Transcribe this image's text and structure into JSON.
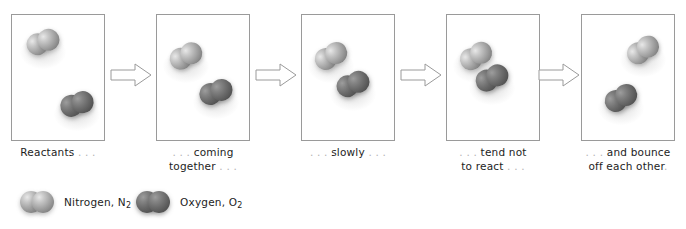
{
  "figure": {
    "panel_count": 5
  },
  "panels": [
    {
      "index": 1,
      "caption_lines": [
        "Reactants . . ."
      ],
      "caption_text": "Reactants . . .",
      "molecules": [
        {
          "species": "nitrogen",
          "label": "N2",
          "x": 14,
          "y": 16,
          "rotation": -22
        },
        {
          "species": "oxygen",
          "label": "O2",
          "x": 48,
          "y": 78,
          "rotation": -18
        }
      ]
    },
    {
      "index": 2,
      "caption_lines": [
        ". . . coming",
        "together . . ."
      ],
      "caption_text": ". . . coming together . . .",
      "molecules": [
        {
          "species": "nitrogen",
          "label": "N2",
          "x": 12,
          "y": 30,
          "rotation": -28
        },
        {
          "species": "oxygen",
          "label": "O2",
          "x": 42,
          "y": 66,
          "rotation": -20
        }
      ]
    },
    {
      "index": 3,
      "caption_lines": [
        ". . . slowly . . ."
      ],
      "caption_text": ". . . slowly . . .",
      "molecules": [
        {
          "species": "nitrogen",
          "label": "N2",
          "x": 12,
          "y": 30,
          "rotation": -30
        },
        {
          "species": "oxygen",
          "label": "O2",
          "x": 34,
          "y": 58,
          "rotation": -22
        }
      ]
    },
    {
      "index": 4,
      "caption_lines": [
        ". . . tend not",
        "to react . . ."
      ],
      "caption_text": ". . . tend not to react . . .",
      "molecules": [
        {
          "species": "nitrogen",
          "label": "N2",
          "x": 12,
          "y": 30,
          "rotation": -32
        },
        {
          "species": "oxygen",
          "label": "O2",
          "x": 28,
          "y": 52,
          "rotation": -26
        }
      ]
    },
    {
      "index": 5,
      "caption_lines": [
        ". . . and bounce",
        "off each other."
      ],
      "caption_text": ". . . and bounce off each other.",
      "molecules": [
        {
          "species": "nitrogen",
          "label": "N2",
          "x": 44,
          "y": 24,
          "rotation": -34
        },
        {
          "species": "oxygen",
          "label": "O2",
          "x": 22,
          "y": 72,
          "rotation": -30
        }
      ]
    }
  ],
  "arrows": [
    {
      "index": 1,
      "direction": "right"
    },
    {
      "index": 2,
      "direction": "right"
    },
    {
      "index": 3,
      "direction": "right"
    },
    {
      "index": 4,
      "direction": "right"
    }
  ],
  "legend": {
    "items": [
      {
        "species": "nitrogen",
        "name": "Nitrogen",
        "formula_base": "N",
        "formula_sub": "2",
        "label_text": "Nitrogen, N2",
        "color": "#8a8a8a"
      },
      {
        "species": "oxygen",
        "name": "Oxygen",
        "formula_base": "O",
        "formula_sub": "2",
        "label_text": "Oxygen, O2",
        "color": "#565656"
      }
    ]
  },
  "colors": {
    "panel_border": "#9a9a9a",
    "arrow_outline": "#9a9a9a",
    "arrow_fill": "#ffffff",
    "caption_text": "#1d1d1d",
    "caption_dots": "#b4b4b4",
    "background": "#ffffff"
  }
}
